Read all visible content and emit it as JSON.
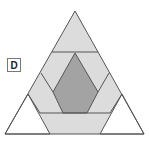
{
  "figure": {
    "label": "D",
    "colors": {
      "outline": "#555555",
      "light_fill": "#dcdcdc",
      "dark_fill": "#a0a0a0",
      "white_fill": "#ffffff"
    },
    "regions": [
      {
        "name": "top-triangle",
        "fill": "light"
      },
      {
        "name": "left-band",
        "fill": "light"
      },
      {
        "name": "right-band",
        "fill": "light"
      },
      {
        "name": "center-hexagon",
        "fill": "dark"
      },
      {
        "name": "bottom-trapezoid",
        "fill": "light"
      },
      {
        "name": "bottom-left-triangle",
        "fill": "white"
      },
      {
        "name": "bottom-right-triangle",
        "fill": "white"
      }
    ]
  }
}
